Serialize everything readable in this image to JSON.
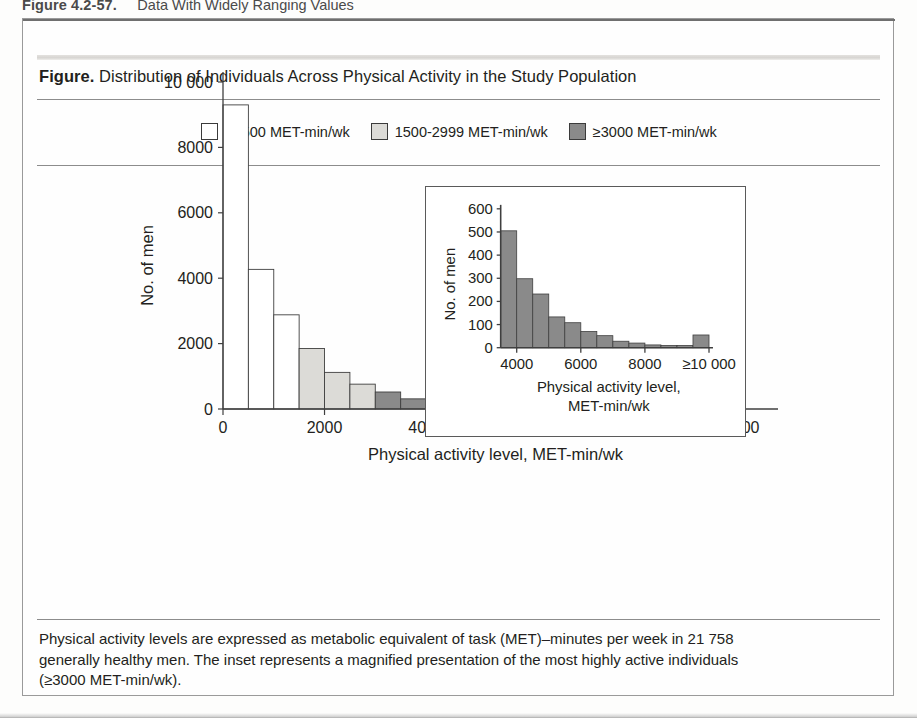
{
  "chapter": {
    "number": "Figure 4.2-57.",
    "title": "Data With Widely Ranging Values"
  },
  "figure": {
    "label": "Figure.",
    "caption": "Distribution of Individuals Across Physical Activity in the Study Population"
  },
  "legend": {
    "items": [
      {
        "label": "<1500 MET-min/wk",
        "color": "#ffffff",
        "border": "#3b3b3b",
        "name": "legend-lt1500"
      },
      {
        "label": "1500-2999 MET-min/wk",
        "color": "#dcdbd7",
        "border": "#3b3b3b",
        "name": "legend-1500-2999"
      },
      {
        "label": "≥3000 MET-min/wk",
        "color": "#8a8a8a",
        "border": "#3b3b3b",
        "name": "legend-ge3000"
      }
    ]
  },
  "footnote": {
    "line1": "Physical activity levels are expressed as metabolic equivalent of task (MET)–minutes per week in 21 758",
    "line2": "generally healthy men. The inset represents a magnified presentation of the most highly active individuals",
    "line3": "(≥3000 MET-min/wk)."
  },
  "chart_data": [
    {
      "id": "main",
      "type": "bar",
      "title": "",
      "xlabel": "Physical activity level, MET-min/wk",
      "ylabel": "No. of men",
      "xlim": [
        0,
        10500
      ],
      "ylim": [
        0,
        10000
      ],
      "grid": false,
      "bin_width": 500,
      "xticks": [
        0,
        2000,
        4000,
        6000,
        8000,
        10000
      ],
      "xticklabels": [
        "0",
        "2000",
        "4000",
        "6000",
        "8000",
        "≥10 000"
      ],
      "yticks": [
        0,
        2000,
        4000,
        6000,
        8000,
        10000
      ],
      "yticklabels": [
        "0",
        "2000",
        "4000",
        "6000",
        "8000",
        "10 000"
      ],
      "bins": [
        {
          "x0": 0,
          "x1": 500,
          "value": 9300,
          "group": "<1500"
        },
        {
          "x0": 500,
          "x1": 1000,
          "value": 4270,
          "group": "<1500"
        },
        {
          "x0": 1000,
          "x1": 1500,
          "value": 2880,
          "group": "<1500"
        },
        {
          "x0": 1500,
          "x1": 2000,
          "value": 1850,
          "group": "1500-2999"
        },
        {
          "x0": 2000,
          "x1": 2500,
          "value": 1120,
          "group": "1500-2999"
        },
        {
          "x0": 2500,
          "x1": 3000,
          "value": 760,
          "group": "1500-2999"
        },
        {
          "x0": 3000,
          "x1": 3500,
          "value": 520,
          "group": "≥3000"
        },
        {
          "x0": 3500,
          "x1": 4000,
          "value": 310,
          "group": "≥3000"
        },
        {
          "x0": 4000,
          "x1": 4500,
          "value": 160,
          "group": "≥3000"
        },
        {
          "x0": 4500,
          "x1": 5000,
          "value": 135,
          "group": "≥3000"
        },
        {
          "x0": 5000,
          "x1": 5500,
          "value": 160,
          "group": "≥3000"
        },
        {
          "x0": 5500,
          "x1": 6000,
          "value": 155,
          "group": "≥3000"
        },
        {
          "x0": 6000,
          "x1": 6500,
          "value": 110,
          "group": "≥3000"
        },
        {
          "x0": 6500,
          "x1": 7000,
          "value": 105,
          "group": "≥3000"
        },
        {
          "x0": 7000,
          "x1": 7500,
          "value": 45,
          "group": "≥3000"
        },
        {
          "x0": 7500,
          "x1": 8000,
          "value": 40,
          "group": "≥3000"
        },
        {
          "x0": 8000,
          "x1": 8500,
          "value": 30,
          "group": "≥3000"
        },
        {
          "x0": 8500,
          "x1": 9000,
          "value": 25,
          "group": "≥3000"
        },
        {
          "x0": 9000,
          "x1": 9500,
          "value": 20,
          "group": "≥3000"
        },
        {
          "x0": 9500,
          "x1": 10000,
          "value": 130,
          "group": "≥3000"
        }
      ]
    },
    {
      "id": "inset",
      "type": "bar",
      "title": "",
      "xlabel_line1": "Physical activity level,",
      "xlabel_line2": "MET-min/wk",
      "ylabel": "No. of men",
      "xlim": [
        3500,
        10000
      ],
      "ylim": [
        0,
        600
      ],
      "grid": false,
      "bin_width": 500,
      "xticks": [
        4000,
        6000,
        8000,
        10000
      ],
      "xticklabels": [
        "4000",
        "6000",
        "8000",
        "≥10 000"
      ],
      "yticks": [
        0,
        100,
        200,
        300,
        400,
        500,
        600
      ],
      "yticklabels": [
        "0",
        "100",
        "200",
        "300",
        "400",
        "500",
        "600"
      ],
      "bins": [
        {
          "x0": 3500,
          "x1": 4000,
          "value": 505,
          "group": "≥3000"
        },
        {
          "x0": 4000,
          "x1": 4500,
          "value": 298,
          "group": "≥3000"
        },
        {
          "x0": 4500,
          "x1": 5000,
          "value": 232,
          "group": "≥3000"
        },
        {
          "x0": 5000,
          "x1": 5500,
          "value": 133,
          "group": "≥3000"
        },
        {
          "x0": 5500,
          "x1": 6000,
          "value": 108,
          "group": "≥3000"
        },
        {
          "x0": 6000,
          "x1": 6500,
          "value": 70,
          "group": "≥3000"
        },
        {
          "x0": 6500,
          "x1": 7000,
          "value": 52,
          "group": "≥3000"
        },
        {
          "x0": 7000,
          "x1": 7500,
          "value": 28,
          "group": "≥3000"
        },
        {
          "x0": 7500,
          "x1": 8000,
          "value": 20,
          "group": "≥3000"
        },
        {
          "x0": 8000,
          "x1": 8500,
          "value": 12,
          "group": "≥3000"
        },
        {
          "x0": 8500,
          "x1": 9000,
          "value": 10,
          "group": "≥3000"
        },
        {
          "x0": 9000,
          "x1": 9500,
          "value": 10,
          "group": "≥3000"
        },
        {
          "x0": 9500,
          "x1": 10000,
          "value": 55,
          "group": "≥3000"
        }
      ]
    }
  ],
  "colors": {
    "group_lt1500": "#ffffff",
    "group_mid": "#dcdbd7",
    "group_ge3000": "#8a8a8a",
    "bar_stroke": "#3f3f3f",
    "axis": "#3f3f3f",
    "text": "#231f20"
  }
}
